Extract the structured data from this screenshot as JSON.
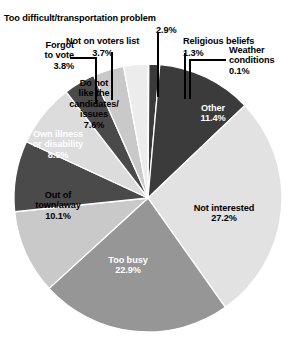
{
  "chart_data": {
    "type": "pie",
    "title": "",
    "subtitle": "",
    "xlabel": "",
    "ylabel": "",
    "units": "percent",
    "legend_position": "none",
    "grid": false,
    "center": {
      "x": 148,
      "y": 198
    },
    "radius": 134,
    "start_angle_deg": -90,
    "direction": "clockwise",
    "categories": [
      "Weather conditions",
      "Religious beliefs",
      "Other",
      "Not interested",
      "Too busy",
      "Out of town/away",
      "Own illness or disability",
      "Do not like the candidates/issues",
      "Forgot to vote",
      "Not on voters list",
      "Too difficult/transportation problem"
    ],
    "values": [
      0.1,
      1.3,
      11.4,
      27.2,
      22.9,
      10.1,
      8.5,
      7.6,
      3.8,
      3.7,
      2.9
    ],
    "colors": [
      "#3b3b3b",
      "#3b3b3b",
      "#3b3b3b",
      "#e2e2e2",
      "#969696",
      "#c9c9c9",
      "#4a4a4a",
      "#dcdcdc",
      "#4a4a4a",
      "#c9c9c9",
      "#ececec"
    ],
    "slices": [
      {
        "label": "Weather conditions",
        "value": 0.1,
        "value_text": "0.1%",
        "color": "#3b3b3b",
        "label_placement": "callout"
      },
      {
        "label": "Religious beliefs",
        "value": 1.3,
        "value_text": "1.3%",
        "color": "#3b3b3b",
        "label_placement": "callout"
      },
      {
        "label": "Other",
        "value": 11.4,
        "value_text": "11.4%",
        "color": "#3b3b3b",
        "label_placement": "inside",
        "text_color": "#ffffff"
      },
      {
        "label": "Not interested",
        "value": 27.2,
        "value_text": "27.2%",
        "color": "#e2e2e2",
        "label_placement": "inside",
        "text_color": "#000000"
      },
      {
        "label": "Too busy",
        "value": 22.9,
        "value_text": "22.9%",
        "color": "#969696",
        "label_placement": "inside",
        "text_color": "#ffffff"
      },
      {
        "label": "Out of town/away",
        "value": 10.1,
        "value_text": "10.1%",
        "color": "#c9c9c9",
        "label_placement": "inside",
        "text_color": "#000000"
      },
      {
        "label": "Own illness or disability",
        "value": 8.5,
        "value_text": "8.5%",
        "color": "#4a4a4a",
        "label_placement": "inside",
        "text_color": "#ffffff"
      },
      {
        "label": "Do not like the candidates/issues",
        "value": 7.6,
        "value_text": "7.6%",
        "color": "#dcdcdc",
        "label_placement": "inside",
        "text_color": "#000000"
      },
      {
        "label": "Forgot to vote",
        "value": 3.8,
        "value_text": "3.8%",
        "color": "#4a4a4a",
        "label_placement": "callout"
      },
      {
        "label": "Not on voters list",
        "value": 3.7,
        "value_text": "3.7%",
        "color": "#c9c9c9",
        "label_placement": "callout"
      },
      {
        "label": "Too difficult/transportation problem",
        "value": 2.9,
        "value_text": "2.9%",
        "color": "#ececec",
        "label_placement": "callout"
      }
    ]
  },
  "callouts": {
    "too_difficult": {
      "label": "Too difficult/transportation problem",
      "value": "2.9%"
    },
    "not_on_voters_list": {
      "label": "Not on voters list",
      "value": "3.7%"
    },
    "religious_beliefs": {
      "label": "Religious beliefs",
      "value": "1.3%"
    },
    "weather_conditions": {
      "label": "Weather\nconditions\n0.1%"
    },
    "forgot_to_vote": {
      "label": "Forgot\nto vote\n3.8%"
    }
  },
  "slice_labels": {
    "do_not_like": "Do not\nlike the\ncandidates/\nissues\n7.6%",
    "own_illness": "Own illness\nor disability\n8.5%",
    "out_of_town": "Out of\ntown/away\n10.1%",
    "too_busy": "Too busy\n22.9%",
    "not_interested": "Not interested\n27.2%",
    "other": "Other\n11.4%"
  },
  "theme": {
    "background": "#ffffff",
    "leader_line_color": "#000000",
    "text_color": "#000000",
    "inverse_text_color": "#ffffff"
  }
}
